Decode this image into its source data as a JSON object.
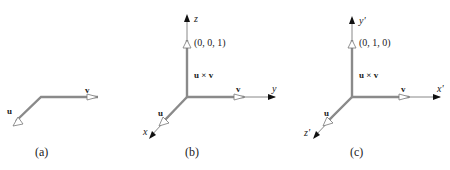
{
  "panels": [
    {
      "id": "a",
      "caption": "(a)",
      "labels": {
        "u": "u",
        "v": "v"
      }
    },
    {
      "id": "b",
      "caption": "(b)",
      "labels": {
        "u": "u",
        "v": "v",
        "cross": "u × v",
        "point": "(0, 0, 1)"
      },
      "axes": {
        "vertical": "z",
        "horizontal": "y",
        "diagonal": "x"
      }
    },
    {
      "id": "c",
      "caption": "(c)",
      "labels": {
        "u": "u",
        "v": "v",
        "cross": "u × v",
        "point": "(0, 1, 0)"
      },
      "axes": {
        "vertical": "y'",
        "horizontal": "x'",
        "diagonal": "z'"
      }
    }
  ]
}
